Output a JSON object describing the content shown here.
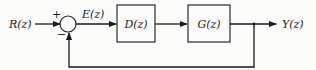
{
  "diagram": {
    "type": "block-diagram",
    "title": "",
    "input_label": "R(z)",
    "error_label": "E(z)",
    "output_label": "Y(z)",
    "summing_junction": {
      "plus_sign": "+",
      "minus_sign": "−"
    },
    "blocks": [
      {
        "id": "controller",
        "label": "D(z)"
      },
      {
        "id": "plant",
        "label": "G(z)"
      }
    ],
    "feedback": "unity negative feedback from Y(z) to summing junction",
    "colors": {
      "line": "#1a1a1a",
      "background": "#fbfbfa"
    }
  }
}
